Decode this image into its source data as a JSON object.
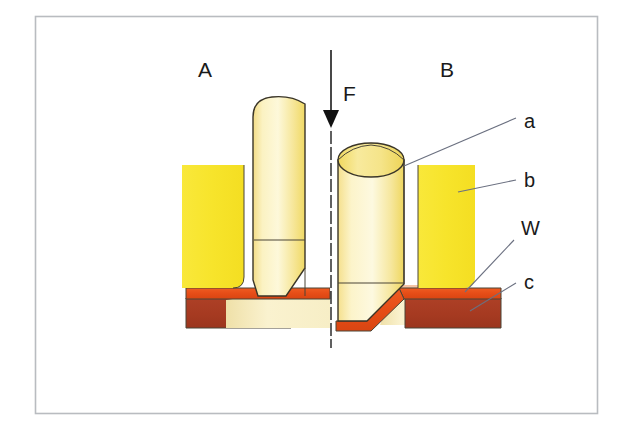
{
  "figure": {
    "frame": {
      "x": 35,
      "y": 16,
      "width": 563,
      "height": 398,
      "border_color": "#b9bcc0"
    },
    "stage_labels": [
      {
        "id": "stage-a",
        "text": "A",
        "x": 205,
        "y": 77
      },
      {
        "id": "stage-b",
        "text": "B",
        "x": 447,
        "y": 77
      }
    ],
    "force": {
      "label": "F",
      "label_x": 343,
      "label_y": 101,
      "arrow_x": 331,
      "arrow_top_y": 50,
      "arrow_tip_y": 127
    },
    "callouts": [
      {
        "id": "callout-a",
        "text": "a",
        "text_x": 524,
        "text_y": 128,
        "leader_x1": 516,
        "leader_y1": 118,
        "leader_x2": 404,
        "leader_y2": 166
      },
      {
        "id": "callout-b",
        "text": "b",
        "text_x": 524,
        "text_y": 187,
        "leader_x1": 516,
        "leader_y1": 180,
        "leader_x2": 458,
        "leader_y2": 192
      },
      {
        "id": "callout-w",
        "text": "W",
        "text_x": 521,
        "text_y": 235,
        "leader_x1": 514,
        "leader_y1": 240,
        "leader_x2": 465,
        "leader_y2": 292
      },
      {
        "id": "callout-c",
        "text": "c",
        "text_x": 524,
        "text_y": 289,
        "leader_x1": 516,
        "leader_y1": 283,
        "leader_x2": 470,
        "leader_y2": 311
      }
    ],
    "colors": {
      "solder_yellow_bright": "#f7e32b",
      "solder_yellow_pale": "#fdf6cf",
      "solder_yellow_mid": "#f5e07f",
      "solder_orange": "#e8501a",
      "substrate_brown": "#a83c22",
      "fillet_peach": "#f4c3a5",
      "outline_dark": "#3a3528",
      "leader_gray": "#6b7080",
      "frame_gray": "#b9bcc0",
      "text_black": "#1a1a1a",
      "background": "#ffffff"
    },
    "parts": {
      "left_pad_label": "b",
      "left_ball_label": "a",
      "left_solder_layer_label": "W",
      "left_substrate_label": "c",
      "right_pad_label": "b",
      "right_ball_label": "a",
      "right_solder_layer_label": "W",
      "right_substrate_label": "c"
    }
  }
}
